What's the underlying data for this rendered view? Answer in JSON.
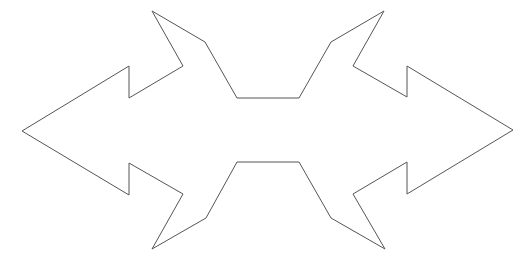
{
  "canvas": {
    "width": 530,
    "height": 265,
    "background": "#ffffff"
  },
  "shape": {
    "name": "double-headed-arrow-outline",
    "stroke": "#555555",
    "stroke_width": 1,
    "fill": "none",
    "points": [
      [
        22,
        131
      ],
      [
        129,
        66
      ],
      [
        129,
        98
      ],
      [
        183,
        66
      ],
      [
        152,
        11
      ],
      [
        205,
        42
      ],
      [
        237,
        98
      ],
      [
        299,
        98
      ],
      [
        331,
        42
      ],
      [
        384,
        11
      ],
      [
        353,
        66
      ],
      [
        407,
        97
      ],
      [
        407,
        66
      ],
      [
        513,
        130
      ],
      [
        407,
        194
      ],
      [
        407,
        162
      ],
      [
        353,
        194
      ],
      [
        385,
        249
      ],
      [
        331,
        218
      ],
      [
        299,
        162
      ],
      [
        237,
        162
      ],
      [
        206,
        218
      ],
      [
        152,
        249
      ],
      [
        183,
        194
      ],
      [
        129,
        163
      ],
      [
        129,
        195
      ]
    ]
  }
}
